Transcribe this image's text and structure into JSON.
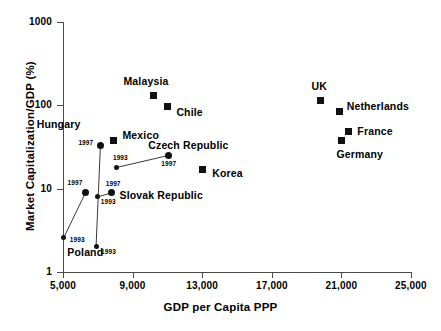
{
  "chart_data": {
    "type": "scatter",
    "title": "",
    "xlabel": "GDP per Capita PPP",
    "ylabel": "Market Capitalization/GDP (%)",
    "xscale": "linear",
    "yscale": "log",
    "xlim": [
      5000,
      25000
    ],
    "ylim": [
      1,
      1000
    ],
    "grid": false,
    "legend": "none",
    "xticks": [
      "5,000",
      "9,000",
      "13,000",
      "17,000",
      "21,000",
      "25,000"
    ],
    "xtick_values": [
      5000,
      9000,
      13000,
      17000,
      21000,
      25000
    ],
    "yticks": [
      "1000",
      "100",
      "10",
      "1"
    ],
    "ytick_values": [
      1000,
      100,
      10,
      1
    ],
    "marker_square_note": "developed / comparator economies, single observation",
    "marker_circle_note": "transition economies, 1993 and 1997 observations joined by a line",
    "points": [
      {
        "name": "Malaysia",
        "marker": "square",
        "x": 10200,
        "y": 130,
        "label_dx": -30,
        "label_dy": -15
      },
      {
        "name": "Chile",
        "marker": "square",
        "x": 11000,
        "y": 98,
        "label_dx": 9,
        "label_dy": 6
      },
      {
        "name": "UK",
        "marker": "square",
        "x": 19800,
        "y": 113,
        "label_dx": -9,
        "label_dy": -15
      },
      {
        "name": "Netherlands",
        "marker": "square",
        "x": 20900,
        "y": 84,
        "label_dx": 7,
        "label_dy": -6
      },
      {
        "name": "France",
        "marker": "square",
        "x": 21400,
        "y": 48,
        "label_dx": 9,
        "label_dy": -1
      },
      {
        "name": "Germany",
        "marker": "square",
        "x": 21000,
        "y": 38,
        "label_dx": -5,
        "label_dy": 14
      },
      {
        "name": "Mexico",
        "marker": "square",
        "x": 7900,
        "y": 38,
        "label_dx": 9,
        "label_dy": -5
      },
      {
        "name": "Korea",
        "marker": "square",
        "x": 13000,
        "y": 17,
        "label_dx": 10,
        "label_dy": 4
      }
    ],
    "series": [
      {
        "name": "Hungary",
        "marker": "circle",
        "label_x": 6000,
        "label_y": 60,
        "label_anchor": "end",
        "observations": [
          {
            "year": "1997",
            "x": 7150,
            "y": 33,
            "year_dx": -22,
            "year_dy": -2
          },
          {
            "year": "1993",
            "x": 6900,
            "y": 2.0,
            "year_dx": 5,
            "year_dy": 5
          }
        ]
      },
      {
        "name": "Poland",
        "marker": "circle",
        "label_x": 5250,
        "label_y": 1.75,
        "label_anchor": "start",
        "observations": [
          {
            "year": "1997",
            "x": 6300,
            "y": 9.0,
            "year_dx": -18,
            "year_dy": -9
          },
          {
            "year": "1993",
            "x": 5050,
            "y": 2.6,
            "year_dx": 6,
            "year_dy": 3
          }
        ]
      },
      {
        "name": "Slovak Republic",
        "marker": "circle",
        "label_x": 8250,
        "label_y": 8.4,
        "label_anchor": "start",
        "observations": [
          {
            "year": "1997",
            "x": 7800,
            "y": 8.9,
            "year_dx": -6,
            "year_dy": -9
          },
          {
            "year": "1993",
            "x": 7000,
            "y": 8.0,
            "year_dx": 3,
            "year_dy": 5
          }
        ]
      },
      {
        "name": "Czech Republic",
        "marker": "circle",
        "label_x": 9900,
        "label_y": 33,
        "label_anchor": "start",
        "observations": [
          {
            "year": "1997",
            "x": 11050,
            "y": 25,
            "year_dx": -7,
            "year_dy": 8
          },
          {
            "year": "1993",
            "x": 8100,
            "y": 18,
            "year_dx": -4,
            "year_dy": -9
          }
        ]
      }
    ]
  }
}
